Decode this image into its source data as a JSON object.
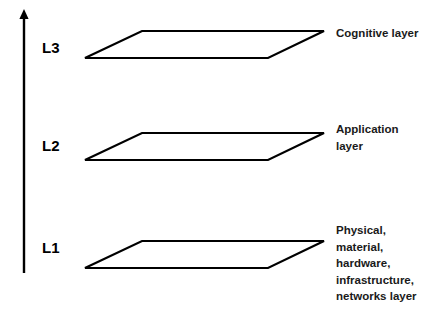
{
  "diagram": {
    "background_color": "#ffffff",
    "stroke_color": "#000000",
    "text_color": "#1a1a1a",
    "axis": {
      "name": "vertical-up-arrow",
      "direction": "up",
      "label": ""
    },
    "layers": [
      {
        "id": "l3",
        "level_label": "L3",
        "caption_lines": [
          "Cognitive layer"
        ],
        "caption_text": "Cognitive layer"
      },
      {
        "id": "l2",
        "level_label": "L2",
        "caption_lines": [
          "Application",
          "layer"
        ],
        "caption_text": "Application layer"
      },
      {
        "id": "l1",
        "level_label": "L1",
        "caption_lines": [
          "Physical,",
          "material,",
          "hardware,",
          "infrastructure,",
          "networks layer"
        ],
        "caption_text": "Physical, material, hardware, infrastructure, networks layer"
      }
    ]
  }
}
